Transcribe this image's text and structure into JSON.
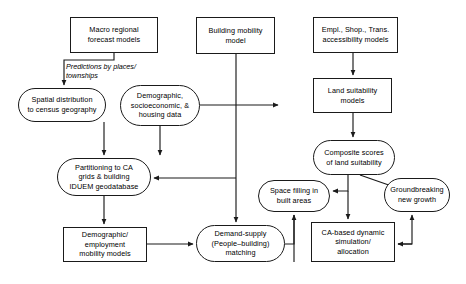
{
  "diagram": {
    "background_color": "#ffffff",
    "line_color": "#1a1a1a",
    "text_color": "#000000",
    "nodes": [
      {
        "id": "macro_forecast",
        "label": "Macro regional\nforecast models",
        "shape": "rect",
        "x": 70,
        "y": 17,
        "w": 88,
        "h": 36
      },
      {
        "id": "building_mobility",
        "label": "Building mobility\nmodel",
        "shape": "rect",
        "x": 196,
        "y": 17,
        "w": 79,
        "h": 37
      },
      {
        "id": "accessibility",
        "label": "Empl., Shop., Trans.\naccessibility models",
        "shape": "rect",
        "x": 313,
        "y": 17,
        "w": 85,
        "h": 36
      },
      {
        "id": "spatial_distribution",
        "label": "Spatial distribution\nto census geography",
        "shape": "rounded",
        "x": 18,
        "y": 88,
        "w": 88,
        "h": 34
      },
      {
        "id": "demographic_data",
        "label": "Demographic,\nsocioeconomic, &\nhousing data",
        "shape": "rounded",
        "x": 120,
        "y": 85,
        "w": 80,
        "h": 41
      },
      {
        "id": "land_suitability",
        "label": "Land suitability\nmodels",
        "shape": "rect",
        "x": 313,
        "y": 78,
        "w": 79,
        "h": 35
      },
      {
        "id": "partitioning_ca",
        "label": "Partitioning to CA\ngrids & building\nIDUEM geodatabase",
        "shape": "rounded",
        "x": 57,
        "y": 158,
        "w": 94,
        "h": 38
      },
      {
        "id": "composite_scores",
        "label": "Composite scores\nof land suitability",
        "shape": "rounded",
        "x": 313,
        "y": 140,
        "w": 82,
        "h": 35
      },
      {
        "id": "space_filling",
        "label": "Space filling in\nbuilt areas",
        "shape": "rounded",
        "x": 258,
        "y": 180,
        "w": 72,
        "h": 32
      },
      {
        "id": "groundbreaking",
        "label": "Groundbreaking\nnew growth",
        "shape": "rounded",
        "x": 384,
        "y": 178,
        "w": 66,
        "h": 34
      },
      {
        "id": "demographic_mobility",
        "label": "Demographic/\nemployment\nmobility models",
        "shape": "rect",
        "x": 63,
        "y": 227,
        "w": 84,
        "h": 35
      },
      {
        "id": "demand_supply",
        "label": "Demand-supply\n(People–building)\nmatching",
        "shape": "rounded",
        "x": 196,
        "y": 225,
        "w": 89,
        "h": 37
      },
      {
        "id": "ca_simulation",
        "label": "CA-based dynamic\nsimulation/\nallocation",
        "shape": "rect",
        "x": 311,
        "y": 222,
        "w": 84,
        "h": 40
      }
    ],
    "edge_labels": [
      {
        "id": "predictions_label",
        "text": "Predictions by places/\ntownships",
        "x": 66,
        "y": 62
      }
    ],
    "edges": [
      {
        "id": "macro-to-spatial",
        "from": "macro_forecast",
        "to": "spatial_distribution"
      },
      {
        "id": "spatial-to-partitioning",
        "from": "spatial_distribution",
        "to": "partitioning_ca"
      },
      {
        "id": "demographic-to-partitioning",
        "from": "demographic_data",
        "to": "partitioning_ca"
      },
      {
        "id": "demographic-to-demand",
        "from": "demographic_data",
        "to": "demand_supply"
      },
      {
        "id": "building-to-demand",
        "from": "building_mobility",
        "to": "demand_supply"
      },
      {
        "id": "partitioning-to-mobility",
        "from": "partitioning_ca",
        "to": "demographic_mobility"
      },
      {
        "id": "mobility-to-demand",
        "from": "demographic_mobility",
        "to": "demand_supply"
      },
      {
        "id": "demand-to-spacefilling",
        "from": "demand_supply",
        "to": "space_filling"
      },
      {
        "id": "demand-to-partitioning",
        "from": "demand_supply",
        "to": "partitioning_ca"
      },
      {
        "id": "accessibility-to-land",
        "from": "accessibility",
        "to": "land_suitability"
      },
      {
        "id": "land-to-composite",
        "from": "land_suitability",
        "to": "composite_scores"
      },
      {
        "id": "composite-to-spacefilling",
        "from": "composite_scores",
        "to": "space_filling"
      },
      {
        "id": "composite-to-groundbreaking",
        "from": "composite_scores",
        "to": "groundbreaking"
      },
      {
        "id": "composite-to-ca",
        "from": "composite_scores",
        "to": "ca_simulation"
      },
      {
        "id": "ca-to-spacefilling",
        "from": "ca_simulation",
        "to": "space_filling"
      },
      {
        "id": "ca-to-groundbreaking",
        "from": "ca_simulation",
        "to": "groundbreaking"
      }
    ]
  }
}
